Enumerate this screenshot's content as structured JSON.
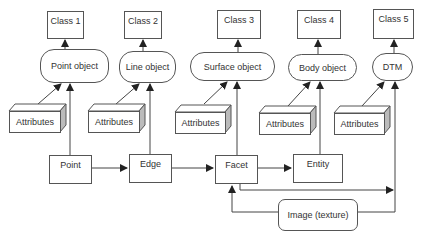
{
  "diagram": {
    "classes": [
      {
        "label": "Class 1"
      },
      {
        "label": "Class 2"
      },
      {
        "label": "Class 3"
      },
      {
        "label": "Class 4"
      },
      {
        "label": "Class 5"
      }
    ],
    "objects": [
      {
        "label": "Point object"
      },
      {
        "label": "Line object"
      },
      {
        "label": "Surface object"
      },
      {
        "label": "Body object"
      },
      {
        "label": "DTM"
      }
    ],
    "attributes": [
      {
        "label": "Attributes"
      },
      {
        "label": "Attributes"
      },
      {
        "label": "Attributes"
      },
      {
        "label": "Attributes"
      },
      {
        "label": "Attributes"
      }
    ],
    "primitives": [
      {
        "label": "Point"
      },
      {
        "label": "Edge"
      },
      {
        "label": "Facet"
      },
      {
        "label": "Entity"
      }
    ],
    "texture": {
      "label": "Image (texture)"
    },
    "colors": {
      "line": "#444444",
      "box_border": "#555555",
      "shade": "#bbbbbb",
      "text": "#333333"
    }
  }
}
